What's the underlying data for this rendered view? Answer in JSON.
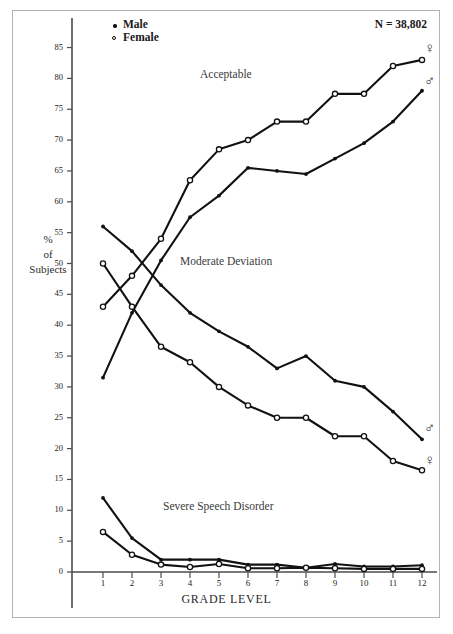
{
  "title_note": "N = 38,802",
  "legend": [
    {
      "label": "Male",
      "marker": "filled-dot"
    },
    {
      "label": "Female",
      "marker": "open-circle"
    }
  ],
  "axes": {
    "y_label_lines": [
      "%",
      "of",
      "Subjects"
    ],
    "x_label": "GRADE LEVEL",
    "y_ticks": [
      0,
      5,
      10,
      15,
      20,
      25,
      30,
      35,
      40,
      45,
      50,
      55,
      60,
      65,
      70,
      75,
      80,
      85
    ],
    "x_ticks": [
      1,
      2,
      3,
      4,
      5,
      6,
      7,
      8,
      9,
      10,
      11,
      12
    ]
  },
  "band_labels": [
    {
      "text": "Acceptable"
    },
    {
      "text": "Moderate Deviation"
    },
    {
      "text": "Severe Speech Disorder"
    }
  ],
  "end_symbols": [
    {
      "symbol": "♀",
      "series": "acceptable-female"
    },
    {
      "symbol": "♂",
      "series": "acceptable-male"
    },
    {
      "symbol": "♂",
      "series": "moderate-male"
    },
    {
      "symbol": "♀",
      "series": "moderate-female"
    }
  ],
  "chart_data": {
    "type": "line",
    "title": "",
    "subtitle": "N = 38,802",
    "xlabel": "GRADE LEVEL",
    "ylabel": "% of Subjects",
    "x": [
      1,
      2,
      3,
      4,
      5,
      6,
      7,
      8,
      9,
      10,
      11,
      12
    ],
    "xlim": [
      1,
      12
    ],
    "ylim": [
      0,
      87
    ],
    "grid": false,
    "legend_position": "top-left",
    "series": [
      {
        "name": "Acceptable - Female",
        "marker": "open-circle",
        "values": [
          43,
          48,
          54,
          63.5,
          68.5,
          70,
          73,
          73,
          77.5,
          77.5,
          82,
          83
        ]
      },
      {
        "name": "Acceptable - Male",
        "marker": "filled-dot",
        "values": [
          31.5,
          42,
          50.5,
          57.5,
          61,
          65.5,
          65,
          64.5,
          67,
          69.5,
          73,
          78
        ]
      },
      {
        "name": "Moderate Deviation - Male",
        "marker": "filled-dot",
        "values": [
          56,
          52,
          46.5,
          42,
          39,
          36.5,
          33,
          35,
          31,
          30,
          26,
          21.5
        ]
      },
      {
        "name": "Moderate Deviation - Female",
        "marker": "open-circle",
        "values": [
          50,
          43,
          36.5,
          34,
          30,
          27,
          25,
          25,
          22,
          22,
          18,
          16.5
        ]
      },
      {
        "name": "Severe Speech Disorder - Male",
        "marker": "filled-dot",
        "values": [
          12,
          5.5,
          2,
          2,
          2,
          1.2,
          1.2,
          0.7,
          1.3,
          0.9,
          0.9,
          1.1
        ]
      },
      {
        "name": "Severe Speech Disorder - Female",
        "marker": "open-circle",
        "values": [
          6.5,
          2.8,
          1.2,
          0.8,
          1.3,
          0.6,
          0.6,
          0.7,
          0.6,
          0.5,
          0.5,
          0.5
        ]
      }
    ]
  }
}
